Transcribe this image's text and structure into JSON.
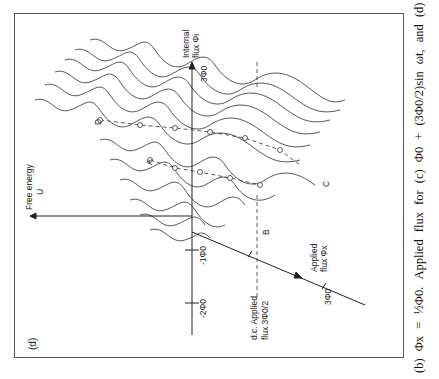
{
  "figure": {
    "panel_label": "(d)",
    "axes": {
      "free_energy": {
        "line1": "Free energy",
        "line2": "U"
      },
      "internal_flux": {
        "line1": "Internal",
        "line2": "flux Φi",
        "tick": "3Φ0"
      },
      "applied_flux": {
        "line1": "Applied",
        "line2": "flux Φx",
        "tick": "3Φ0"
      },
      "vertical_ticks": [
        "-1Φ0",
        "-2Φ0"
      ]
    },
    "dc_label": {
      "line1": "d.c. Applied",
      "line2": "flux 3Φ0/2"
    },
    "point_labels": [
      "A",
      "B",
      "C",
      "D"
    ]
  },
  "caption": {
    "text": "(b)  Φx = ½Φ0.  Applied  flux  for  (c)  Φ0 + (3Φ0/2)sin ωt,  and  (d)"
  }
}
